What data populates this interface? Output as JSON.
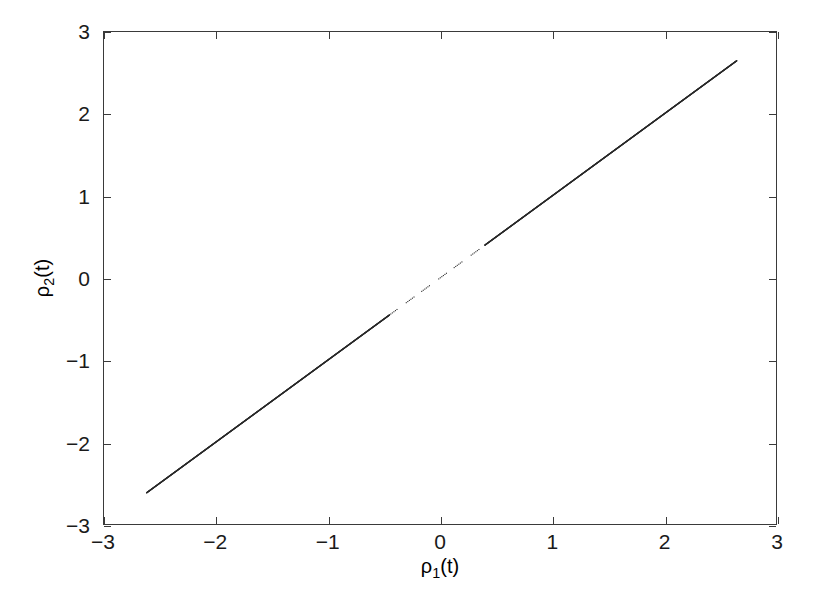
{
  "figure": {
    "background_color": "#ffffff",
    "axis_color": "#3a3a3a",
    "data_color": "#2b2b2b"
  },
  "axis_labels": {
    "x_rho": "ρ",
    "x_sub": "1",
    "x_arg": "(t)",
    "y_rho": "ρ",
    "y_sub": "2",
    "y_arg": "(t)"
  },
  "chart_data": {
    "type": "scatter",
    "title": "",
    "subtitle": "",
    "xlabel": "ρ₁(t)",
    "ylabel": "ρ₂(t)",
    "xlim": [
      -3,
      3
    ],
    "ylim": [
      -3,
      3
    ],
    "xticks": [
      -3,
      -2,
      -1,
      0,
      1,
      2,
      3
    ],
    "yticks": [
      -3,
      -2,
      -1,
      0,
      1,
      2,
      3
    ],
    "xticklabels": [
      "-3",
      "-2",
      "-1",
      "0",
      "1",
      "2",
      "3"
    ],
    "yticklabels": [
      "-3",
      "-2",
      "-1",
      "0",
      "1",
      "2",
      "3"
    ],
    "grid": false,
    "legend": null,
    "annotations": [],
    "series": [
      {
        "name": "rho2 vs rho1",
        "marker": "dot",
        "marker_size": 1,
        "color": "#2b2b2b",
        "description": "Near-perfect diagonal identity relation: rho2(t) = rho1(t); dense continuous trace over the outer branches, sparse dotted sampling near the origin.",
        "relation": {
          "slope": 1.0,
          "intercept": 0.0
        },
        "x_range_drawn": [
          -2.62,
          2.65
        ],
        "sparse_region_x": [
          -0.45,
          0.4
        ],
        "points": [
          [
            -2.62,
            -2.62
          ],
          [
            -2.5,
            -2.5
          ],
          [
            -2.4,
            -2.4
          ],
          [
            -2.3,
            -2.3
          ],
          [
            -2.2,
            -2.2
          ],
          [
            -2.1,
            -2.1
          ],
          [
            -2.0,
            -2.0
          ],
          [
            -1.9,
            -1.9
          ],
          [
            -1.8,
            -1.8
          ],
          [
            -1.7,
            -1.7
          ],
          [
            -1.6,
            -1.6
          ],
          [
            -1.5,
            -1.5
          ],
          [
            -1.4,
            -1.4
          ],
          [
            -1.3,
            -1.3
          ],
          [
            -1.2,
            -1.2
          ],
          [
            -1.1,
            -1.1
          ],
          [
            -1.0,
            -1.0
          ],
          [
            -0.9,
            -0.9
          ],
          [
            -0.8,
            -0.8
          ],
          [
            -0.7,
            -0.7
          ],
          [
            -0.6,
            -0.6
          ],
          [
            -0.5,
            -0.5
          ],
          [
            -0.45,
            -0.45
          ],
          [
            -0.4,
            -0.4
          ],
          [
            -0.3,
            -0.3
          ],
          [
            -0.2,
            -0.2
          ],
          [
            -0.1,
            -0.1
          ],
          [
            0.0,
            0.0
          ],
          [
            0.1,
            0.1
          ],
          [
            0.2,
            0.2
          ],
          [
            0.3,
            0.3
          ],
          [
            0.4,
            0.4
          ],
          [
            0.5,
            0.5
          ],
          [
            0.6,
            0.6
          ],
          [
            0.7,
            0.7
          ],
          [
            0.8,
            0.8
          ],
          [
            0.9,
            0.9
          ],
          [
            1.0,
            1.0
          ],
          [
            1.1,
            1.1
          ],
          [
            1.2,
            1.2
          ],
          [
            1.3,
            1.3
          ],
          [
            1.4,
            1.4
          ],
          [
            1.5,
            1.5
          ],
          [
            1.6,
            1.6
          ],
          [
            1.7,
            1.7
          ],
          [
            1.8,
            1.8
          ],
          [
            1.9,
            1.9
          ],
          [
            2.0,
            2.0
          ],
          [
            2.1,
            2.1
          ],
          [
            2.2,
            2.2
          ],
          [
            2.3,
            2.3
          ],
          [
            2.4,
            2.4
          ],
          [
            2.5,
            2.5
          ],
          [
            2.6,
            2.6
          ],
          [
            2.65,
            2.62
          ]
        ]
      }
    ]
  }
}
